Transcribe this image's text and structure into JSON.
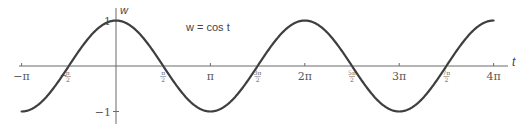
{
  "chart_data": {
    "type": "line",
    "title": "w = cos t",
    "xlabel": "t",
    "ylabel": "w",
    "function": "cos",
    "xlim": [
      -3.14159,
      12.56637
    ],
    "ylim": [
      -1,
      1
    ],
    "grid": false,
    "legend": null,
    "x_ticks": [
      {
        "value": -3.14159,
        "label": "−π",
        "kind": "main"
      },
      {
        "value": -1.5708,
        "label": "π/2",
        "num": "π",
        "den": "2",
        "neg": true,
        "kind": "frac"
      },
      {
        "value": 1.5708,
        "label": "π/2",
        "num": "π",
        "den": "2",
        "kind": "frac"
      },
      {
        "value": 3.14159,
        "label": "π",
        "kind": "main"
      },
      {
        "value": 4.71239,
        "label": "3π/2",
        "num": "3π",
        "den": "2",
        "kind": "frac"
      },
      {
        "value": 6.28319,
        "label": "2π",
        "kind": "main"
      },
      {
        "value": 7.85398,
        "label": "5π/2",
        "num": "5π",
        "den": "2",
        "kind": "frac"
      },
      {
        "value": 9.42478,
        "label": "3π",
        "kind": "main"
      },
      {
        "value": 10.99557,
        "label": "7π/2",
        "num": "7π",
        "den": "2",
        "kind": "frac"
      },
      {
        "value": 12.56637,
        "label": "4π",
        "kind": "main"
      }
    ],
    "y_ticks": [
      {
        "value": 1,
        "label": "1"
      },
      {
        "value": -1,
        "label": "−1"
      }
    ],
    "series": [
      {
        "name": "w = cos t",
        "x": [
          -3.14159,
          -1.5708,
          0,
          1.5708,
          3.14159,
          4.71239,
          6.28319,
          7.85398,
          9.42478,
          10.99557,
          12.56637
        ],
        "values": [
          -1,
          0,
          1,
          0,
          -1,
          0,
          1,
          0,
          -1,
          0,
          1
        ]
      }
    ],
    "annotations": [
      {
        "text": "w = cos t",
        "position": "upper-middle-left"
      }
    ]
  },
  "labels": {
    "t_axis": "t",
    "w_axis": "w",
    "equation": "w = cos t"
  },
  "colors": {
    "curve": "#3f3f3f",
    "axis": "#6a6a6a",
    "text": "#444444"
  }
}
